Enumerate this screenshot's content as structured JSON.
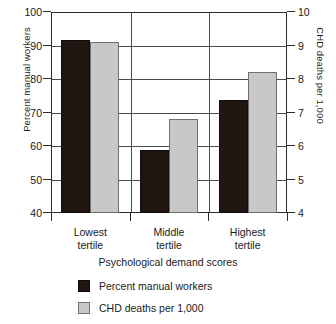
{
  "chart_data": {
    "type": "bar",
    "title": "",
    "xlabel": "Psychological demand scores",
    "categories": [
      "Lowest tertile",
      "Middle tertile",
      "Highest tertile"
    ],
    "category_lines": [
      [
        "Lowest",
        "tertile"
      ],
      [
        "Middle",
        "tertile"
      ],
      [
        "Highest",
        "tertile"
      ]
    ],
    "grid": true,
    "legend_position": "bottom",
    "axes": {
      "left": {
        "label": "Percent manual workers",
        "ylim": [
          40,
          100
        ],
        "ticks": [
          100,
          90,
          80,
          70,
          60,
          50,
          40
        ],
        "tick_labels": [
          "100",
          "90",
          "80",
          "70",
          "60",
          "50",
          "40"
        ]
      },
      "right": {
        "label": "CHD deaths per 1,000",
        "ylim": [
          4,
          10
        ],
        "ticks": [
          10,
          9,
          8,
          7,
          6,
          5,
          4
        ],
        "tick_labels": [
          "10",
          "9",
          "8",
          "7",
          "6",
          "5",
          "4"
        ]
      }
    },
    "series": [
      {
        "name": "Percent manual workers",
        "axis": "left",
        "color": "#201510",
        "values": [
          91.5,
          58.7,
          73.7
        ]
      },
      {
        "name": "CHD deaths per 1,000",
        "axis": "right",
        "color": "#c8c8c8",
        "values": [
          9.1,
          6.8,
          8.2
        ]
      }
    ]
  },
  "legend": {
    "items": [
      {
        "label": "Percent manual workers",
        "color": "#201510"
      },
      {
        "label": "CHD deaths per 1,000",
        "color": "#c8c8c8"
      }
    ]
  }
}
